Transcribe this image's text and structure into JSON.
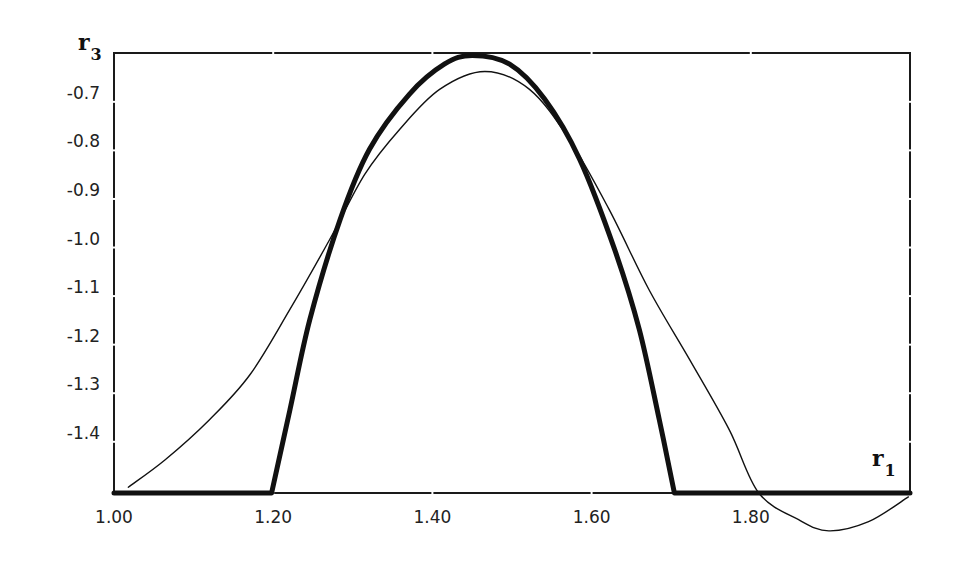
{
  "chart_data": {
    "type": "line",
    "title": "",
    "xlabel": "r1",
    "ylabel": "r3",
    "xlabel_main": "r",
    "xlabel_sub": "1",
    "ylabel_main": "r",
    "ylabel_sub": "3",
    "xlim": [
      1.0,
      2.0
    ],
    "ylim": [
      -1.524,
      -0.618
    ],
    "grid": false,
    "legend": null,
    "x_ticks": [
      1.0,
      1.2,
      1.4,
      1.6,
      1.8
    ],
    "x_tick_labels": [
      "1.00",
      "1.20",
      "1.40",
      "1.60",
      "1.80"
    ],
    "y_ticks": [
      -0.7,
      -0.8,
      -0.9,
      -1.0,
      -1.1,
      -1.2,
      -1.3,
      -1.4
    ],
    "y_tick_labels": [
      "-0.7",
      "-0.8",
      "-0.9",
      "-1.0",
      "-1.1",
      "-1.2",
      "-1.3",
      "-1.4"
    ],
    "series": [
      {
        "name": "thick curve",
        "style": "thick",
        "x": [
          1.0,
          1.198,
          1.221,
          1.246,
          1.284,
          1.321,
          1.371,
          1.415,
          1.45,
          1.497,
          1.541,
          1.585,
          1.629,
          1.66,
          1.685,
          1.704,
          2.0
        ],
        "y": [
          -1.524,
          -1.524,
          -1.353,
          -1.167,
          -0.961,
          -0.816,
          -0.703,
          -0.641,
          -0.623,
          -0.641,
          -0.713,
          -0.837,
          -1.023,
          -1.188,
          -1.373,
          -1.524,
          -1.524
        ]
      },
      {
        "name": "thin curve",
        "style": "thin",
        "x": [
          1.018,
          1.064,
          1.12,
          1.171,
          1.221,
          1.271,
          1.315,
          1.359,
          1.409,
          1.466,
          1.522,
          1.572,
          1.622,
          1.672,
          1.723,
          1.773,
          1.81,
          1.86,
          1.898,
          1.948,
          1.998
        ],
        "y": [
          -1.512,
          -1.456,
          -1.373,
          -1.28,
          -1.146,
          -1.002,
          -0.868,
          -0.775,
          -0.693,
          -0.656,
          -0.693,
          -0.796,
          -0.94,
          -1.105,
          -1.249,
          -1.394,
          -1.524,
          -1.579,
          -1.602,
          -1.583,
          -1.532
        ]
      }
    ]
  }
}
